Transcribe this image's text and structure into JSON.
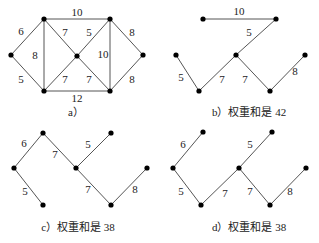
{
  "panels": [
    {
      "id": "a",
      "caption": "a）",
      "caption_pos": [
        76,
        113
      ],
      "nodes": [
        [
          11,
          55
        ],
        [
          44,
          19
        ],
        [
          44,
          91
        ],
        [
          77,
          56
        ],
        [
          110,
          19
        ],
        [
          110,
          91
        ],
        [
          143,
          55
        ]
      ],
      "edges": [
        {
          "from": 0,
          "to": 1,
          "w": "6",
          "lp": [
            21,
            32
          ]
        },
        {
          "from": 0,
          "to": 2,
          "w": "5",
          "lp": [
            21,
            80
          ]
        },
        {
          "from": 1,
          "to": 2,
          "w": "8",
          "lp": [
            35,
            56
          ]
        },
        {
          "from": 1,
          "to": 3,
          "w": "7",
          "lp": [
            65,
            33
          ]
        },
        {
          "from": 1,
          "to": 4,
          "w": "10",
          "lp": [
            77,
            13
          ]
        },
        {
          "from": 2,
          "to": 3,
          "w": "7",
          "lp": [
            65,
            80
          ]
        },
        {
          "from": 2,
          "to": 5,
          "w": "12",
          "lp": [
            77,
            99
          ]
        },
        {
          "from": 3,
          "to": 4,
          "w": "5",
          "lp": [
            89,
            33
          ]
        },
        {
          "from": 3,
          "to": 5,
          "w": "7",
          "lp": [
            89,
            80
          ]
        },
        {
          "from": 4,
          "to": 5,
          "w": "10",
          "lp": [
            103,
            55
          ]
        },
        {
          "from": 4,
          "to": 6,
          "w": "8",
          "lp": [
            132,
            33
          ]
        },
        {
          "from": 5,
          "to": 6,
          "w": "8",
          "lp": [
            132,
            80
          ]
        }
      ]
    },
    {
      "id": "b",
      "caption": "b）权重和是 42",
      "caption_pos": [
        249,
        113
      ],
      "nodes": [
        [
          203,
          19
        ],
        [
          176,
          55
        ],
        [
          199,
          91
        ],
        [
          236,
          55
        ],
        [
          276,
          19
        ],
        [
          270,
          91
        ],
        [
          305,
          55
        ]
      ],
      "edges": [
        {
          "from": 0,
          "to": 4,
          "w": "10",
          "lp": [
            239,
            12
          ]
        },
        {
          "from": 3,
          "to": 4,
          "w": "5",
          "lp": [
            249,
            33
          ]
        },
        {
          "from": 1,
          "to": 2,
          "w": "5",
          "lp": [
            181,
            78
          ]
        },
        {
          "from": 2,
          "to": 3,
          "w": "7",
          "lp": [
            222,
            80
          ]
        },
        {
          "from": 3,
          "to": 5,
          "w": "7",
          "lp": [
            245,
            80
          ]
        },
        {
          "from": 5,
          "to": 6,
          "w": "8",
          "lp": [
            295,
            72
          ]
        }
      ]
    },
    {
      "id": "c",
      "caption": "c）权重和是 38",
      "caption_pos": [
        78,
        228
      ],
      "nodes": [
        [
          43,
          133
        ],
        [
          14,
          168
        ],
        [
          43,
          205
        ],
        [
          76,
          168
        ],
        [
          111,
          133
        ],
        [
          111,
          205
        ],
        [
          147,
          168
        ]
      ],
      "edges": [
        {
          "from": 0,
          "to": 1,
          "w": "6",
          "lp": [
            24,
            144
          ]
        },
        {
          "from": 1,
          "to": 2,
          "w": "5",
          "lp": [
            25,
            192
          ]
        },
        {
          "from": 0,
          "to": 3,
          "w": "7",
          "lp": [
            55,
            155
          ]
        },
        {
          "from": 3,
          "to": 4,
          "w": "5",
          "lp": [
            88,
            145
          ]
        },
        {
          "from": 3,
          "to": 5,
          "w": "7",
          "lp": [
            88,
            190
          ]
        },
        {
          "from": 5,
          "to": 6,
          "w": "8",
          "lp": [
            135,
            190
          ]
        }
      ]
    },
    {
      "id": "d",
      "caption": "d）权重和是 38",
      "caption_pos": [
        249,
        228
      ],
      "nodes": [
        [
          203,
          132
        ],
        [
          173,
          168
        ],
        [
          201,
          205
        ],
        [
          239,
          168
        ],
        [
          272,
          132
        ],
        [
          270,
          205
        ],
        [
          306,
          168
        ]
      ],
      "edges": [
        {
          "from": 0,
          "to": 1,
          "w": "6",
          "lp": [
            183,
            145
          ]
        },
        {
          "from": 1,
          "to": 2,
          "w": "5",
          "lp": [
            181,
            192
          ]
        },
        {
          "from": 2,
          "to": 3,
          "w": "7",
          "lp": [
            225,
            194
          ]
        },
        {
          "from": 3,
          "to": 4,
          "w": "5",
          "lp": [
            250,
            145
          ]
        },
        {
          "from": 3,
          "to": 5,
          "w": "7",
          "lp": [
            250,
            192
          ]
        },
        {
          "from": 5,
          "to": 6,
          "w": "8",
          "lp": [
            290,
            192
          ]
        }
      ]
    }
  ]
}
